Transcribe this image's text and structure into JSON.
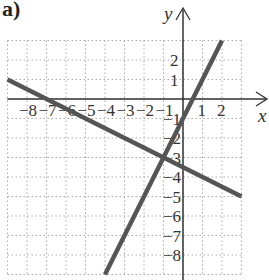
{
  "panel_label": "a)",
  "chart_data": {
    "type": "line",
    "title": "",
    "xlabel": "x",
    "ylabel": "y",
    "xlim": [
      -9,
      3
    ],
    "ylim": [
      -9,
      3
    ],
    "grid": true,
    "x_tick_labels": [
      "-8",
      "-7",
      "-6",
      "-5",
      "-4",
      "-3",
      "-2",
      "-1",
      "1",
      "2"
    ],
    "y_tick_labels": [
      "2",
      "1",
      "-1",
      "-2",
      "-3",
      "-4",
      "-5",
      "-6",
      "-7",
      "-8"
    ],
    "series": [
      {
        "name": "steep line",
        "equation": "y = 2x - 1",
        "x": [
          -4,
          2
        ],
        "y": [
          -9,
          3
        ]
      },
      {
        "name": "shallow line",
        "equation": "y = -0.5x - 3.5",
        "x": [
          -9,
          3
        ],
        "y": [
          1,
          -5
        ]
      }
    ],
    "intersection": {
      "x": -1,
      "y": -3
    },
    "line_color": "#555555"
  }
}
